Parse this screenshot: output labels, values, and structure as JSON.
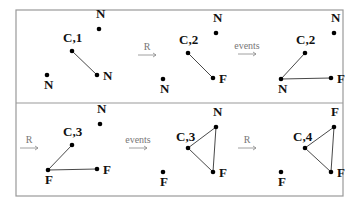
{
  "frame": {
    "x": 16,
    "y": 10,
    "w": 327,
    "h": 186,
    "divider_y": 103,
    "stroke": "#999999"
  },
  "edge_color": "#333333",
  "transitions": [
    {
      "label": "R",
      "x": 138,
      "y": 55,
      "len": 18
    },
    {
      "label": "events",
      "x": 238,
      "y": 54,
      "len": 18
    },
    {
      "label": "R",
      "x": 20,
      "y": 148,
      "len": 18
    },
    {
      "label": "events",
      "x": 129,
      "y": 148,
      "len": 18
    },
    {
      "label": "R",
      "x": 238,
      "y": 148,
      "len": 18
    }
  ],
  "states": [
    {
      "nodes": [
        {
          "id": "c",
          "x": 72,
          "y": 51,
          "label": "C,1",
          "lx": -9,
          "ly": -9
        },
        {
          "id": "n1",
          "x": 99,
          "y": 29,
          "label": "N",
          "lx": -3,
          "ly": -11
        },
        {
          "id": "n2",
          "x": 97,
          "y": 75,
          "label": "N",
          "lx": 6,
          "ly": 5
        },
        {
          "id": "n3",
          "x": 47,
          "y": 75,
          "label": "N",
          "lx": -3,
          "ly": 14
        }
      ],
      "edges": [
        [
          "c",
          "n2"
        ]
      ]
    },
    {
      "nodes": [
        {
          "id": "c",
          "x": 188,
          "y": 53,
          "label": "C,2",
          "lx": -9,
          "ly": -9
        },
        {
          "id": "n1",
          "x": 216,
          "y": 33,
          "label": "N",
          "lx": -3,
          "ly": -11
        },
        {
          "id": "f1",
          "x": 213,
          "y": 78,
          "label": "F",
          "lx": 6,
          "ly": 5
        },
        {
          "id": "n3",
          "x": 163,
          "y": 79,
          "label": "N",
          "lx": -3,
          "ly": 14
        }
      ],
      "edges": [
        [
          "c",
          "f1"
        ]
      ]
    },
    {
      "nodes": [
        {
          "id": "c",
          "x": 305,
          "y": 53,
          "label": "C,2",
          "lx": -9,
          "ly": -9
        },
        {
          "id": "n1",
          "x": 334,
          "y": 33,
          "label": "N",
          "lx": -3,
          "ly": -11
        },
        {
          "id": "f1",
          "x": 331,
          "y": 78,
          "label": "F",
          "lx": 6,
          "ly": 5
        },
        {
          "id": "n3",
          "x": 281,
          "y": 79,
          "label": "N",
          "lx": -3,
          "ly": 14
        }
      ],
      "edges": [
        [
          "n3",
          "c"
        ],
        [
          "n3",
          "f1"
        ]
      ]
    },
    {
      "nodes": [
        {
          "id": "c",
          "x": 72,
          "y": 145,
          "label": "C,3",
          "lx": -9,
          "ly": -9
        },
        {
          "id": "n1",
          "x": 100,
          "y": 124,
          "label": "N",
          "lx": -3,
          "ly": -11
        },
        {
          "id": "f2",
          "x": 97,
          "y": 169,
          "label": "F",
          "lx": 6,
          "ly": 5
        },
        {
          "id": "f3",
          "x": 48,
          "y": 170,
          "label": "F",
          "lx": -3,
          "ly": 14
        }
      ],
      "edges": [
        [
          "f3",
          "c"
        ],
        [
          "f3",
          "f2"
        ]
      ]
    },
    {
      "nodes": [
        {
          "id": "c",
          "x": 188,
          "y": 148,
          "label": "C,3",
          "lx": -12,
          "ly": -7
        },
        {
          "id": "n1",
          "x": 216,
          "y": 127,
          "label": "N",
          "lx": -3,
          "ly": -11
        },
        {
          "id": "f2",
          "x": 213,
          "y": 172,
          "label": "F",
          "lx": 6,
          "ly": 5
        },
        {
          "id": "f3",
          "x": 163,
          "y": 172,
          "label": "F",
          "lx": -3,
          "ly": 14
        }
      ],
      "edges": [
        [
          "c",
          "n1"
        ],
        [
          "c",
          "f2"
        ],
        [
          "n1",
          "f2"
        ]
      ]
    },
    {
      "nodes": [
        {
          "id": "c",
          "x": 305,
          "y": 148,
          "label": "C,4",
          "lx": -12,
          "ly": -7
        },
        {
          "id": "f1",
          "x": 334,
          "y": 127,
          "label": "F",
          "lx": -3,
          "ly": -11
        },
        {
          "id": "f2",
          "x": 331,
          "y": 172,
          "label": "F",
          "lx": 6,
          "ly": 5
        },
        {
          "id": "f3",
          "x": 281,
          "y": 172,
          "label": "F",
          "lx": -3,
          "ly": 14
        }
      ],
      "edges": [
        [
          "c",
          "f1"
        ],
        [
          "c",
          "f2"
        ],
        [
          "f1",
          "f2"
        ]
      ]
    }
  ]
}
